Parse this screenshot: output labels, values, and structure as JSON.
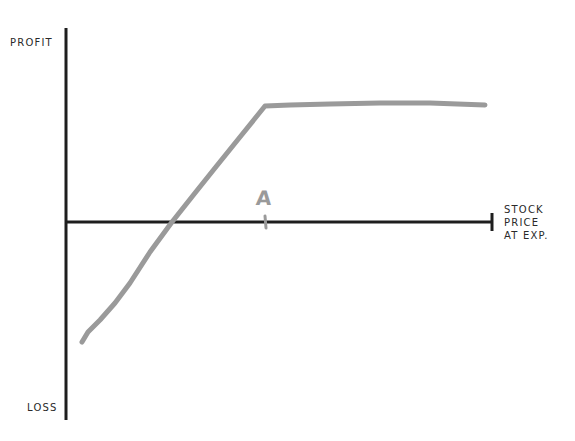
{
  "diagram": {
    "type": "payoff-diagram",
    "y_axis": {
      "top_label": "PROFIT",
      "bottom_label": "LOSS"
    },
    "x_axis": {
      "label_lines": [
        "STOCK",
        "PRICE",
        "AT EXP."
      ],
      "label": "STOCK\nPRICE\nAT EXP."
    },
    "marker": {
      "label": "A"
    },
    "colors": {
      "axis": "#1e1e1e",
      "payoff_line": "#9a9a9a",
      "text": "#2a2a2a",
      "background": "#ffffff"
    },
    "payoff_line": {
      "description": "Rises linearly from a loss, crosses zero, kinks at point A and then flattens",
      "points_px": [
        [
          82,
          342
        ],
        [
          100,
          320
        ],
        [
          130,
          283
        ],
        [
          172,
          222
        ],
        [
          215,
          168
        ],
        [
          265,
          106
        ],
        [
          300,
          105
        ],
        [
          380,
          103
        ],
        [
          485,
          105
        ]
      ]
    }
  }
}
